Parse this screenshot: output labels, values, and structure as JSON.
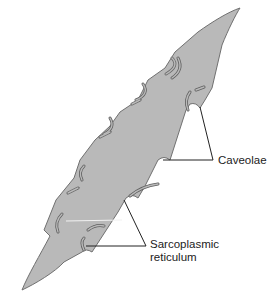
{
  "diagram": {
    "labels": {
      "caveolae": "Caveolae",
      "sarcoplasmic_reticulum_line1": "Sarcoplasmic",
      "sarcoplasmic_reticulum_line2": "reticulum"
    },
    "colors": {
      "cell_fill": "#b9b9b9",
      "cell_outline": "#707070",
      "leader_line": "#222222",
      "background": "#ffffff"
    }
  }
}
